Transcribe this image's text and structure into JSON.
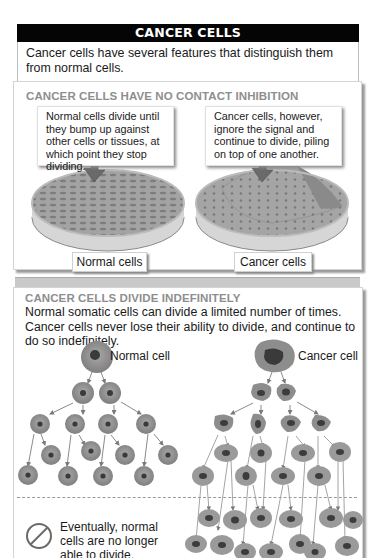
{
  "header": {
    "title": "CANCER CELLS",
    "intro": "Cancer cells have several features that distinguish them from normal cells."
  },
  "contact_inhibition": {
    "title": "CANCER CELLS HAVE NO CONTACT INHIBITION",
    "normal_callout": "Normal cells divide until they bump up against other cells or tissues, at which point they stop dividing.",
    "cancer_callout": "Cancer cells, however, ignore the signal and continue to divide, piling on top of one another.",
    "normal_label": "Normal cells",
    "cancer_label": "Cancer cells"
  },
  "divide_indefinitely": {
    "title": "CANCER CELLS DIVIDE INDEFINITELY",
    "body": "Normal somatic cells can divide a limited number of times. Cancer cells never lose their ability to divide, and continue to do so indefinitely.",
    "normal_cell_label": "Normal cell",
    "cancer_cell_label": "Cancer cell",
    "note": "Eventually, normal cells are no longer able to divide.",
    "note_icon": "prohibited-icon"
  },
  "colors": {
    "title_bar": "#050505",
    "section_title": "#8e8e8e",
    "cell_fill": "#8f8f8f",
    "cell_nucleus": "#3a3a3a",
    "arrow": "#6a6a6a"
  }
}
